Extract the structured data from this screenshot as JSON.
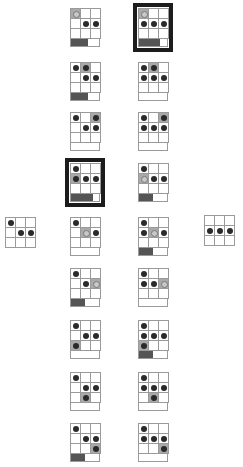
{
  "colors": {
    "grid_line": "#9a9a9a",
    "dot": "#2a2a2a",
    "shade": "#a9a9a9",
    "bar_fill": "#555555",
    "highlight_border": "#1c1c1c"
  },
  "legend": {
    "d": "dark dot",
    "r": "ring",
    "g": "grey cell",
    "gd": "grey cell with dot",
    "gr": "grey cell with ring",
    ".": "empty"
  },
  "side_grids": [
    {
      "x": 5,
      "y": 217,
      "cells": [
        [
          "d",
          ".",
          "."
        ],
        [
          ".",
          "d",
          "d"
        ],
        [
          ".",
          ".",
          "."
        ]
      ]
    },
    {
      "x": 204,
      "y": 215,
      "cells": [
        [
          ".",
          ".",
          "."
        ],
        [
          "d",
          "d",
          "d"
        ],
        [
          ".",
          ".",
          "."
        ]
      ]
    }
  ],
  "columns": [
    {
      "x": 70,
      "cards": [
        {
          "y": 8,
          "hl": false,
          "bar": 0.6,
          "cells": [
            [
              "gr",
              ".",
              "."
            ],
            [
              ".",
              "d",
              "d"
            ],
            [
              ".",
              ".",
              "."
            ]
          ]
        },
        {
          "y": 62,
          "hl": false,
          "bar": 0.6,
          "cells": [
            [
              "d",
              "gd",
              "."
            ],
            [
              ".",
              "d",
              "d"
            ],
            [
              ".",
              ".",
              "."
            ]
          ]
        },
        {
          "y": 112,
          "hl": false,
          "bar": 0,
          "cells": [
            [
              "d",
              ".",
              "gd"
            ],
            [
              ".",
              "d",
              "d"
            ],
            [
              ".",
              ".",
              "."
            ]
          ]
        },
        {
          "y": 163,
          "hl": true,
          "bar": 0.8,
          "cells": [
            [
              "d",
              ".",
              "."
            ],
            [
              "gd",
              "d",
              "d"
            ],
            [
              ".",
              ".",
              "."
            ]
          ]
        },
        {
          "y": 217,
          "hl": false,
          "bar": 0,
          "cells": [
            [
              "d",
              ".",
              "."
            ],
            [
              ".",
              "gr",
              "d"
            ],
            [
              ".",
              ".",
              "."
            ]
          ]
        },
        {
          "y": 268,
          "hl": false,
          "bar": 0.5,
          "cells": [
            [
              "d",
              ".",
              "."
            ],
            [
              ".",
              "d",
              "gr"
            ],
            [
              ".",
              ".",
              "."
            ]
          ]
        },
        {
          "y": 320,
          "hl": false,
          "bar": 0,
          "cells": [
            [
              "d",
              ".",
              "."
            ],
            [
              ".",
              "d",
              "d"
            ],
            [
              "gd",
              ".",
              "."
            ]
          ]
        },
        {
          "y": 372,
          "hl": false,
          "bar": 0,
          "cells": [
            [
              "d",
              ".",
              "."
            ],
            [
              ".",
              "d",
              "d"
            ],
            [
              ".",
              "gd",
              "."
            ]
          ]
        },
        {
          "y": 423,
          "hl": false,
          "bar": 0.5,
          "cells": [
            [
              "d",
              ".",
              "."
            ],
            [
              ".",
              "d",
              "d"
            ],
            [
              ".",
              ".",
              "gd"
            ]
          ]
        }
      ]
    },
    {
      "x": 138,
      "cards": [
        {
          "y": 8,
          "hl": true,
          "bar": 0.75,
          "cells": [
            [
              "gr",
              ".",
              "."
            ],
            [
              "d",
              "d",
              "d"
            ],
            [
              ".",
              ".",
              "."
            ]
          ]
        },
        {
          "y": 62,
          "hl": false,
          "bar": 0,
          "cells": [
            [
              "d",
              "gd",
              "."
            ],
            [
              "d",
              "d",
              "d"
            ],
            [
              ".",
              ".",
              "."
            ]
          ]
        },
        {
          "y": 112,
          "hl": false,
          "bar": 0,
          "cells": [
            [
              "d",
              ".",
              "gd"
            ],
            [
              "d",
              "d",
              "d"
            ],
            [
              ".",
              ".",
              "."
            ]
          ]
        },
        {
          "y": 163,
          "hl": false,
          "bar": 0.5,
          "cells": [
            [
              "d",
              ".",
              "."
            ],
            [
              "gr",
              "d",
              "d"
            ],
            [
              ".",
              ".",
              "."
            ]
          ]
        },
        {
          "y": 217,
          "hl": false,
          "bar": 0.5,
          "cells": [
            [
              "d",
              ".",
              "."
            ],
            [
              "d",
              "gr",
              "d"
            ],
            [
              ".",
              ".",
              "."
            ]
          ]
        },
        {
          "y": 268,
          "hl": false,
          "bar": 0,
          "cells": [
            [
              "d",
              ".",
              "."
            ],
            [
              "d",
              "d",
              "gr"
            ],
            [
              ".",
              ".",
              "."
            ]
          ]
        },
        {
          "y": 320,
          "hl": false,
          "bar": 0.5,
          "cells": [
            [
              "d",
              ".",
              "."
            ],
            [
              "d",
              "d",
              "d"
            ],
            [
              "gd",
              ".",
              "."
            ]
          ]
        },
        {
          "y": 372,
          "hl": false,
          "bar": 0,
          "cells": [
            [
              "d",
              ".",
              "."
            ],
            [
              "d",
              "d",
              "d"
            ],
            [
              ".",
              "gd",
              "."
            ]
          ]
        },
        {
          "y": 423,
          "hl": false,
          "bar": 0,
          "cells": [
            [
              "d",
              ".",
              "."
            ],
            [
              "d",
              "d",
              "d"
            ],
            [
              ".",
              ".",
              "gd"
            ]
          ]
        }
      ]
    }
  ]
}
